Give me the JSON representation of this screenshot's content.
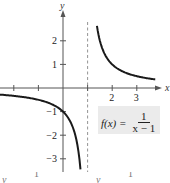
{
  "chart_data": {
    "type": "line",
    "title": "",
    "function_label": {
      "lhs": "f(x) =",
      "numerator": "1",
      "denominator": "x − 1"
    },
    "xlabel": "x",
    "ylabel": "y",
    "xlim": [
      -2.6,
      3.8
    ],
    "ylim": [
      -3.5,
      3.0
    ],
    "x_ticks": [
      -2,
      -1,
      0,
      1,
      2,
      3
    ],
    "x_tick_labels": [
      {
        "value": 2,
        "label": "2"
      },
      {
        "value": 3,
        "label": "3"
      }
    ],
    "y_ticks": [
      -3,
      -2,
      -1,
      1,
      2
    ],
    "y_tick_labels": [
      {
        "value": 2,
        "label": "2"
      },
      {
        "value": 1,
        "label": "1"
      },
      {
        "value": -1,
        "label": "−1"
      },
      {
        "value": -2,
        "label": "−2"
      },
      {
        "value": -3,
        "label": "−3"
      }
    ],
    "asymptotes": [
      {
        "type": "vertical",
        "x": 1,
        "style": "dashed"
      }
    ],
    "series": [
      {
        "name": "left branch",
        "function": "1/(x-1)",
        "domain": [
          -2.6,
          0.71
        ],
        "points": [
          [
            -2.6,
            -0.28
          ],
          [
            -2,
            -0.33
          ],
          [
            -1,
            -0.5
          ],
          [
            0,
            -1
          ],
          [
            0.5,
            -2
          ],
          [
            0.67,
            -3
          ],
          [
            0.71,
            -3.45
          ]
        ]
      },
      {
        "name": "right branch",
        "function": "1/(x-1)",
        "domain": [
          1.38,
          3.75
        ],
        "points": [
          [
            1.38,
            2.63
          ],
          [
            1.5,
            2
          ],
          [
            2,
            1
          ],
          [
            3,
            0.5
          ],
          [
            3.75,
            0.36
          ]
        ]
      }
    ],
    "grid": false,
    "legend": "none"
  },
  "bottom_fragments": [
    "y",
    "1",
    "y",
    "1"
  ]
}
